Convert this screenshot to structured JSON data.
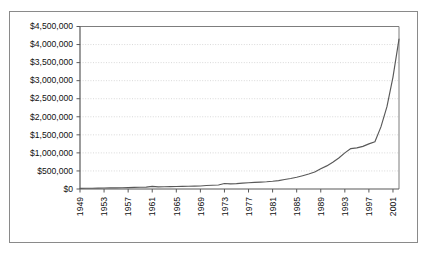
{
  "figure": {
    "border_color": "#8a8a8a",
    "background": "#ffffff"
  },
  "chart_data": {
    "type": "line",
    "title": "",
    "subtitle": "",
    "xlabel": "",
    "ylabel": "",
    "grid": true,
    "legend": null,
    "legend_position": "none",
    "line_color": "#595959",
    "axis_color": "#595959",
    "gridline_color": "#c9c9c9",
    "xlim": [
      1949,
      2002
    ],
    "ylim": [
      0,
      4500000
    ],
    "ytick_labels": [
      "$4,500,000",
      "$4,000,000",
      "$3,500,000",
      "$3,000,000",
      "$2,500,000",
      "$2,000,000",
      "$1,500,000",
      "$1,000,000",
      "$500,000",
      "$0"
    ],
    "ytick_values": [
      4500000,
      4000000,
      3500000,
      3000000,
      2500000,
      2000000,
      1500000,
      1000000,
      500000,
      0
    ],
    "xtick_labels": [
      "1949",
      "1953",
      "1957",
      "1961",
      "1965",
      "1969",
      "1973",
      "1977",
      "1981",
      "1985",
      "1989",
      "1993",
      "1997",
      "2001"
    ],
    "xtick_values": [
      1949,
      1953,
      1957,
      1961,
      1965,
      1969,
      1973,
      1977,
      1981,
      1985,
      1989,
      1993,
      1997,
      2001
    ],
    "x": [
      1949,
      1950,
      1951,
      1952,
      1953,
      1954,
      1955,
      1956,
      1957,
      1958,
      1959,
      1960,
      1961,
      1962,
      1963,
      1964,
      1965,
      1966,
      1967,
      1968,
      1969,
      1970,
      1971,
      1972,
      1973,
      1974,
      1975,
      1976,
      1977,
      1978,
      1979,
      1980,
      1981,
      1982,
      1983,
      1984,
      1985,
      1986,
      1987,
      1988,
      1989,
      1990,
      1991,
      1992,
      1993,
      1994,
      1995,
      1996,
      1997,
      1998,
      1999,
      2000,
      2001,
      2002
    ],
    "values": [
      18000,
      20000,
      22000,
      25000,
      28000,
      30000,
      33000,
      36000,
      40000,
      44000,
      48000,
      52000,
      72000,
      60000,
      62000,
      66000,
      70000,
      73000,
      76000,
      80000,
      84000,
      96000,
      104000,
      112000,
      152000,
      142000,
      150000,
      162000,
      172000,
      182000,
      190000,
      200000,
      214000,
      232000,
      262000,
      292000,
      326000,
      368000,
      414000,
      470000,
      560000,
      640000,
      740000,
      860000,
      1000000,
      1120000,
      1140000,
      1180000,
      1250000,
      1310000,
      1720000,
      2280000,
      3100000,
      4150000
    ]
  }
}
